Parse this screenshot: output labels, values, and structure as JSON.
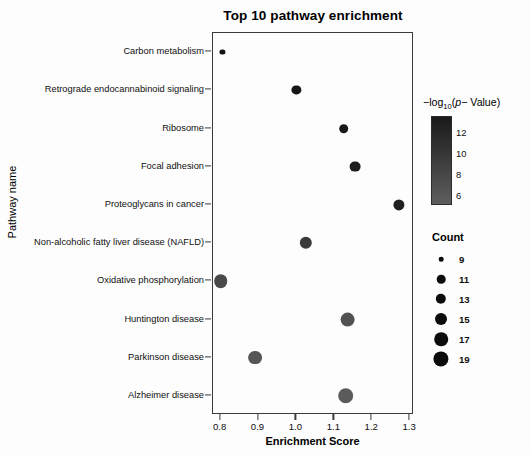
{
  "chart_data": {
    "type": "scatter",
    "title": "Top 10 pathway enrichment",
    "xlabel": "Enrichment Score",
    "ylabel": "Pathway name",
    "xlim": [
      0.78,
      1.31
    ],
    "ylim": [
      0,
      11
    ],
    "grid": false,
    "xticks": [
      0.8,
      0.9,
      1.0,
      1.1,
      1.2,
      1.3
    ],
    "xtick_labels": [
      "0.8",
      "0.9",
      "1.0",
      "1.1",
      "1.2",
      "1.3"
    ],
    "categories": [
      "Carbon metabolism",
      "Retrograde endocannabinoid signaling",
      "Ribosome",
      "Focal adhesion",
      "Proteoglycans in cancer",
      "Non-alcoholic fatty liver disease (NAFLD)",
      "Oxidative phosphorylation",
      "Huntington disease",
      "Parkinson disease",
      "Alzheimer disease"
    ],
    "points": [
      {
        "pathway": "Carbon metabolism",
        "enrichment_score": 0.805,
        "count": 9,
        "neglog10_p": 13.2,
        "color": "#141414",
        "radius_px": 2.6
      },
      {
        "pathway": "Retrograde endocannabinoid signaling",
        "enrichment_score": 1.0,
        "count": 13,
        "neglog10_p": 12.6,
        "color": "#161616",
        "radius_px": 4.6
      },
      {
        "pathway": "Ribosome",
        "enrichment_score": 1.125,
        "count": 13,
        "neglog10_p": 12.4,
        "color": "#191919",
        "radius_px": 4.8
      },
      {
        "pathway": "Focal adhesion",
        "enrichment_score": 1.155,
        "count": 15,
        "neglog10_p": 11.6,
        "color": "#1d1d1d",
        "radius_px": 5.4
      },
      {
        "pathway": "Proteoglycans in cancer",
        "enrichment_score": 1.27,
        "count": 15,
        "neglog10_p": 11.0,
        "color": "#202020",
        "radius_px": 5.6
      },
      {
        "pathway": "Non-alcoholic fatty liver disease (NAFLD)",
        "enrichment_score": 1.025,
        "count": 16,
        "neglog10_p": 9.4,
        "color": "#3a3a3a",
        "radius_px": 6.2
      },
      {
        "pathway": "Oxidative phosphorylation",
        "enrichment_score": 0.8,
        "count": 17,
        "neglog10_p": 8.4,
        "color": "#4a4a4a",
        "radius_px": 6.8
      },
      {
        "pathway": "Huntington disease",
        "enrichment_score": 1.135,
        "count": 18,
        "neglog10_p": 7.2,
        "color": "#515151",
        "radius_px": 7.4
      },
      {
        "pathway": "Parkinson disease",
        "enrichment_score": 0.89,
        "count": 17,
        "neglog10_p": 6.6,
        "color": "#565656",
        "radius_px": 6.9
      },
      {
        "pathway": "Alzheimer disease",
        "enrichment_score": 1.13,
        "count": 19,
        "neglog10_p": 5.6,
        "color": "#5b5b5b",
        "radius_px": 7.8
      }
    ],
    "color_legend": {
      "title_prefix": "−log",
      "title_sub": "10",
      "title_open": "(",
      "title_italic": "p",
      "title_rest": "− Value)",
      "ticks": [
        12,
        10,
        8,
        6
      ],
      "tick_labels": [
        "12",
        "10",
        "8",
        "6"
      ],
      "gradient_high_color": "#1a1a1a",
      "gradient_low_color": "#5e5e5e",
      "range": [
        5,
        13.5
      ]
    },
    "size_legend": {
      "title": "Count",
      "values": [
        9,
        11,
        13,
        15,
        17,
        19
      ],
      "labels": [
        "9",
        "11",
        "13",
        "15",
        "17",
        "19"
      ],
      "radii_px": [
        2.3,
        4.3,
        5.2,
        6.0,
        6.8,
        7.6
      ],
      "dot_color": "#0c0c0c"
    }
  }
}
